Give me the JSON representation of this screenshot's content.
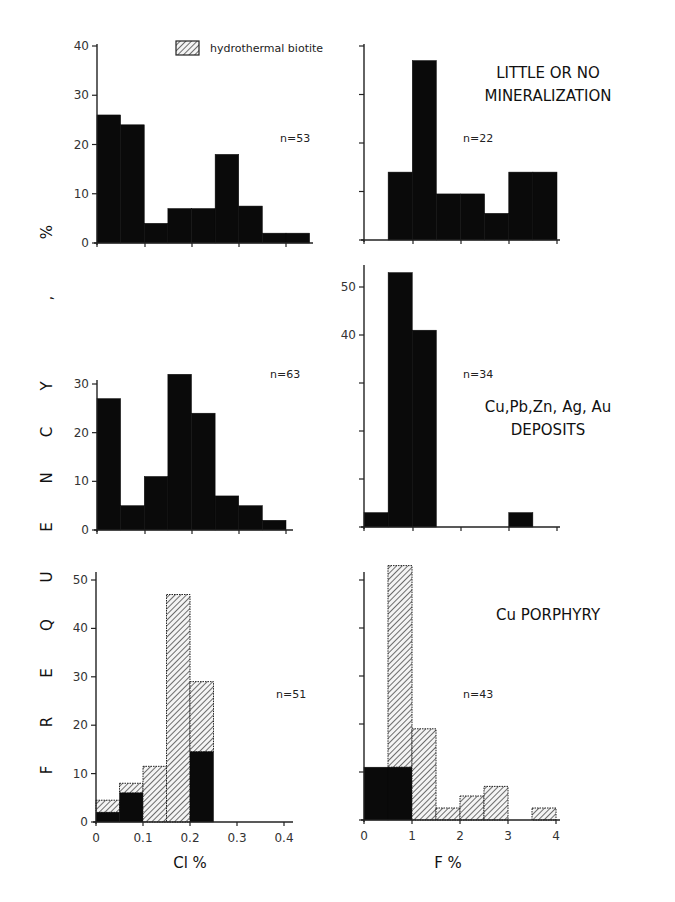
{
  "chart_data": {
    "type": "bar",
    "title": "",
    "ylabel": "FREQUENCY, %",
    "legend": [
      {
        "label": "hydrothermal biotite",
        "pattern": "hatched"
      }
    ],
    "colors": {
      "solid": "#0a0a0a",
      "hatched_fg": "#333333",
      "hatched_bg": "#f4f4f4",
      "axis": "#222222"
    },
    "columns": [
      {
        "xlabel": "Cl %",
        "xticks": [
          "0",
          "0.1",
          "0.2",
          "0.3",
          "0.4"
        ],
        "bin_width": 0.05
      },
      {
        "xlabel": "F %",
        "xticks": [
          "0",
          "1",
          "2",
          "3",
          "4"
        ],
        "bin_width": 0.5
      }
    ],
    "rows": [
      {
        "label": "LITTLE OR NO MINERALIZATION",
        "label_lines": [
          "LITTLE OR NO",
          "MINERALIZATION"
        ]
      },
      {
        "label": "Cu,Pb,Zn,Ag,Au DEPOSITS",
        "label_lines": [
          "Cu,Pb,Zn, Ag, Au",
          "DEPOSITS"
        ]
      },
      {
        "label": "Cu PORPHYRY",
        "label_lines": [
          "Cu PORPHYRY"
        ]
      }
    ],
    "panels": [
      {
        "id": "cl-little",
        "variable": "Cl %",
        "row": "LITTLE OR NO MINERALIZATION",
        "n": "n=53",
        "ylim": [
          0,
          40
        ],
        "yticks": [
          "0",
          "10",
          "20",
          "30",
          "40"
        ],
        "bins": [
          0,
          0.05,
          0.1,
          0.15,
          0.2,
          0.25,
          0.3,
          0.35,
          0.4,
          0.45
        ],
        "series": [
          {
            "name": "other biotite",
            "values": [
              26,
              24,
              4,
              7,
              7,
              18,
              7.5,
              2,
              2
            ]
          },
          {
            "name": "hydrothermal biotite",
            "values": [
              0,
              0,
              0,
              0,
              0,
              0,
              0,
              0,
              0
            ]
          }
        ]
      },
      {
        "id": "f-little",
        "variable": "F %",
        "row": "LITTLE OR NO MINERALIZATION",
        "n": "n=22",
        "ylim": [
          0,
          40
        ],
        "yticks": [
          "",
          "",
          "",
          "",
          ""
        ],
        "bins": [
          0,
          0.5,
          1,
          1.5,
          2,
          2.5,
          3,
          3.5,
          4
        ],
        "series": [
          {
            "name": "other biotite",
            "values": [
              0,
              14,
              37,
              9.5,
              9.5,
              5.5,
              14,
              14
            ]
          },
          {
            "name": "hydrothermal biotite",
            "values": [
              0,
              0,
              0,
              0,
              0,
              0,
              0,
              0
            ]
          }
        ]
      },
      {
        "id": "cl-deposits",
        "variable": "Cl %",
        "row": "Cu,Pb,Zn,Ag,Au DEPOSITS",
        "n": "n=63",
        "ylim": [
          0,
          30
        ],
        "yticks": [
          "0",
          "10",
          "20",
          "30"
        ],
        "bins": [
          0,
          0.05,
          0.1,
          0.15,
          0.2,
          0.25,
          0.3,
          0.35,
          0.4,
          0.45
        ],
        "series": [
          {
            "name": "other biotite",
            "values": [
              27,
              5,
              11,
              32,
              24,
              7,
              5,
              2,
              0
            ]
          },
          {
            "name": "hydrothermal biotite",
            "values": [
              0,
              0,
              0,
              0,
              0,
              0,
              0,
              0,
              0
            ]
          }
        ]
      },
      {
        "id": "f-deposits",
        "variable": "F %",
        "row": "Cu,Pb,Zn,Ag,Au DEPOSITS",
        "n": "n=34",
        "ylim": [
          0,
          55
        ],
        "yticks": [
          "",
          "",
          "",
          "40",
          "50"
        ],
        "bins": [
          0,
          0.5,
          1,
          1.5,
          2,
          2.5,
          3,
          3.5,
          4
        ],
        "series": [
          {
            "name": "other biotite",
            "values": [
              3,
              53,
              41,
              0,
              0,
              0,
              3,
              0
            ]
          },
          {
            "name": "hydrothermal biotite",
            "values": [
              0,
              0,
              0,
              0,
              0,
              0,
              0,
              0
            ]
          }
        ]
      },
      {
        "id": "cl-porphyry",
        "variable": "Cl %",
        "row": "Cu PORPHYRY",
        "n": "n=51",
        "ylim": [
          0,
          50
        ],
        "yticks": [
          "0",
          "10",
          "20",
          "30",
          "40",
          "50"
        ],
        "bins": [
          0,
          0.05,
          0.1,
          0.15,
          0.2,
          0.25,
          0.3,
          0.35,
          0.4
        ],
        "series": [
          {
            "name": "other biotite",
            "values": [
              2,
              6,
              0,
              0,
              14.5,
              0,
              0,
              0
            ]
          },
          {
            "name": "hydrothermal biotite",
            "values": [
              2.5,
              2,
              11.5,
              47,
              14.5,
              0,
              0,
              0
            ]
          }
        ]
      },
      {
        "id": "f-porphyry",
        "variable": "F %",
        "row": "Cu PORPHYRY",
        "n": "n=43",
        "ylim": [
          0,
          50
        ],
        "yticks": [
          "",
          "",
          "",
          "",
          "",
          ""
        ],
        "bins": [
          0,
          0.5,
          1,
          1.5,
          2,
          2.5,
          3,
          3.5,
          4
        ],
        "series": [
          {
            "name": "other biotite",
            "values": [
              11,
              11,
              0,
              0,
              0,
              0,
              0,
              0
            ]
          },
          {
            "name": "hydrothermal biotite",
            "values": [
              0,
              42,
              19,
              2.5,
              5,
              7,
              0,
              2.5
            ]
          }
        ]
      }
    ]
  },
  "labels": {
    "y_axis_letters": [
      "F",
      "R",
      "E",
      "Q",
      "U",
      "E",
      "N",
      "C",
      "Y",
      ","
    ],
    "y_axis_unit": "%",
    "x_axis_left": "Cl %",
    "x_axis_right": "F %",
    "legend_label": "hydrothermal biotite"
  }
}
